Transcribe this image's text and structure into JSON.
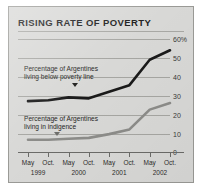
{
  "chart_data": {
    "type": "line",
    "title": "RISING RATE OF POVERTY",
    "xlabel": "",
    "ylabel": "",
    "ylim": [
      0,
      60
    ],
    "yticks": [
      0,
      10,
      20,
      30,
      40,
      50,
      60
    ],
    "ytick_labels": [
      "0",
      "10",
      "20",
      "30",
      "40",
      "50",
      "60%"
    ],
    "grid": true,
    "legend_position": "inline-annotations",
    "categories": [
      "May 1999",
      "Oct. 1999",
      "May 2000",
      "Oct. 2000",
      "May 2001",
      "Oct. 2001",
      "May 2002",
      "Oct. 2002"
    ],
    "x_tick_labels": [
      "May",
      "Oct.",
      "May",
      "Oct.",
      "May",
      "Oct.",
      "May",
      "Oct."
    ],
    "x_year_labels": [
      "1999",
      "2000",
      "2001",
      "2002"
    ],
    "series": [
      {
        "name": "Percentage of Argentines living below poverty line",
        "color": "#1a1a1a",
        "values": [
          27,
          27.5,
          29,
          28.5,
          32,
          35.5,
          49,
          54
        ]
      },
      {
        "name": "Percentage of Argentines living in indigence",
        "color": "#8c8c89",
        "values": [
          6.5,
          6.5,
          7,
          7.5,
          9.5,
          12,
          22.5,
          26
        ]
      }
    ],
    "annotations": [
      {
        "id": "poverty",
        "line1": "Percentage of Argentines",
        "line2": "living below poverty line"
      },
      {
        "id": "indigence",
        "line1": "Percentage of Argentines",
        "line2": "living in indigence"
      }
    ],
    "colors": {
      "background": "#d8d8d6",
      "frame": "#9a9a96",
      "gridline": "#a6a6a2",
      "axis": "#6b6b68",
      "poverty_line": "#1a1a1a",
      "indigence_line": "#8c8c89",
      "title_text": "#1b1b1b"
    }
  }
}
